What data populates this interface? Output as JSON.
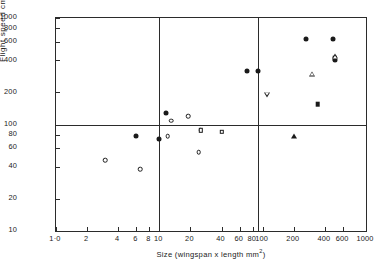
{
  "chart_data": {
    "type": "scatter",
    "title": "",
    "xlabel": "Size (wingspan x length  mm2)",
    "xlabel_base": "Size (wingspan x length  mm",
    "xlabel_sup": "2",
    "xlabel_tail": ")",
    "ylabel": "Flight speed  cm/sec",
    "xscale": "log",
    "yscale": "log",
    "xlim": [
      1.0,
      1000
    ],
    "ylim": [
      10,
      1000
    ],
    "grid": false,
    "reference_lines": {
      "vertical": [
        10,
        90
      ],
      "horizontal": [
        100
      ]
    },
    "xticks": [
      1.0,
      2,
      4,
      6,
      8,
      10,
      20,
      40,
      60,
      80,
      100,
      200,
      400,
      600,
      1000
    ],
    "xticklabels": [
      "1·0",
      "2",
      "4",
      "6",
      "8",
      "10",
      "20",
      "40",
      "60",
      "80",
      "100",
      "200",
      "400",
      "600",
      "1000"
    ],
    "yticks": [
      10,
      20,
      40,
      60,
      80,
      100,
      200,
      400,
      600,
      800,
      1000
    ],
    "yticklabels": [
      "10",
      "20",
      "40",
      "60",
      "80",
      "100",
      "200",
      "400",
      "600",
      "800",
      "1000"
    ],
    "series": [
      {
        "name": "filled-circle",
        "marker": "circle-filled",
        "points": [
          {
            "x": 6.0,
            "y": 78
          },
          {
            "x": 10.0,
            "y": 73
          },
          {
            "x": 11.5,
            "y": 128
          },
          {
            "x": 70,
            "y": 320
          },
          {
            "x": 90,
            "y": 320
          },
          {
            "x": 260,
            "y": 640
          },
          {
            "x": 480,
            "y": 640
          },
          {
            "x": 500,
            "y": 405
          }
        ]
      },
      {
        "name": "open-circle",
        "marker": "circle-open",
        "points": [
          {
            "x": 3.0,
            "y": 46
          },
          {
            "x": 6.5,
            "y": 38
          },
          {
            "x": 12.0,
            "y": 78
          },
          {
            "x": 13.0,
            "y": 108
          },
          {
            "x": 19.0,
            "y": 120
          },
          {
            "x": 24.0,
            "y": 55
          },
          {
            "x": 25.0,
            "y": 88
          }
        ]
      },
      {
        "name": "open-square",
        "marker": "square-open",
        "points": [
          {
            "x": 25.0,
            "y": 88
          },
          {
            "x": 40.0,
            "y": 85
          }
        ]
      },
      {
        "name": "filled-square",
        "marker": "square-filled",
        "points": [
          {
            "x": 340,
            "y": 155
          },
          {
            "x": 500,
            "y": 420
          }
        ]
      },
      {
        "name": "open-triangle-up",
        "marker": "triangle-up-open",
        "points": [
          {
            "x": 300,
            "y": 300
          },
          {
            "x": 505,
            "y": 440
          }
        ]
      },
      {
        "name": "filled-triangle-up",
        "marker": "triangle-up-filled",
        "points": [
          {
            "x": 200,
            "y": 78
          }
        ]
      },
      {
        "name": "open-triangle-down",
        "marker": "triangle-down-open",
        "points": [
          {
            "x": 110,
            "y": 190
          }
        ]
      }
    ]
  }
}
